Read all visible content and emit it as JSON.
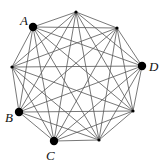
{
  "diagram": {
    "type": "complete-graph",
    "name": "K9",
    "vertices": [
      {
        "id": "v0",
        "x": 76,
        "y": 12,
        "label": "",
        "highlighted": false
      },
      {
        "id": "v1",
        "x": 117,
        "y": 28,
        "label": "",
        "highlighted": false
      },
      {
        "id": "v2",
        "x": 142,
        "y": 66,
        "label": "D",
        "highlighted": true,
        "lx": 149,
        "ly": 71
      },
      {
        "id": "v3",
        "x": 133,
        "y": 111,
        "label": "",
        "highlighted": false
      },
      {
        "id": "v4",
        "x": 99,
        "y": 140,
        "label": "",
        "highlighted": false
      },
      {
        "id": "v5",
        "x": 54,
        "y": 141,
        "label": "C",
        "highlighted": true,
        "lx": 46,
        "ly": 160
      },
      {
        "id": "v6",
        "x": 19,
        "y": 112,
        "label": "B",
        "highlighted": true,
        "lx": 5,
        "ly": 122
      },
      {
        "id": "v7",
        "x": 12,
        "y": 67,
        "label": "",
        "highlighted": false
      },
      {
        "id": "v8",
        "x": 33,
        "y": 27,
        "label": "A",
        "highlighted": true,
        "lx": 20,
        "ly": 25
      }
    ],
    "colors": {
      "edge": "#555555",
      "vertex": "#000000"
    }
  }
}
